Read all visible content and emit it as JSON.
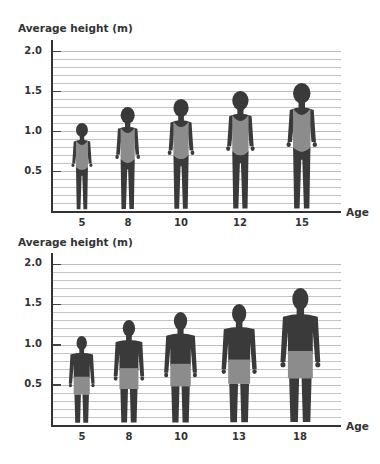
{
  "colors": {
    "body": "#3a3a3a",
    "clothing": "#8c8c8c",
    "grid": "#c4c4c4",
    "axis": "#333333"
  },
  "chart_data": [
    {
      "type": "bar",
      "title": "Average height by age (girls)",
      "ylabel": "Average height (m)",
      "xlabel": "Age",
      "categories": [
        "5",
        "8",
        "10",
        "12",
        "15"
      ],
      "values": [
        1.1,
        1.3,
        1.4,
        1.5,
        1.6
      ],
      "yticks": [
        "2.0",
        "1.5",
        "1.0",
        "0.5"
      ],
      "ylim": [
        0,
        2.0
      ],
      "minor_grid_step": 0.1,
      "grid": true,
      "marker": "girl-silhouette"
    },
    {
      "type": "bar",
      "title": "Average height by age (boys)",
      "ylabel": "Average height (m)",
      "xlabel": "Age",
      "categories": [
        "5",
        "8",
        "10",
        "13",
        "18"
      ],
      "values": [
        1.1,
        1.3,
        1.4,
        1.5,
        1.7
      ],
      "yticks": [
        "2.0",
        "1.5",
        "1.0",
        "0.5"
      ],
      "ylim": [
        0,
        2.0
      ],
      "minor_grid_step": 0.1,
      "grid": true,
      "marker": "boy-silhouette"
    }
  ],
  "charts": [
    {
      "ylabel": "Average height (m)",
      "xlabel": "Age",
      "yticks": [
        "2.0",
        "1.5",
        "1.0",
        "0.5"
      ],
      "xticks": [
        "5",
        "8",
        "10",
        "12",
        "15"
      ]
    },
    {
      "ylabel": "Average height (m)",
      "xlabel": "Age",
      "yticks": [
        "2.0",
        "1.5",
        "1.0",
        "0.5"
      ],
      "xticks": [
        "5",
        "8",
        "10",
        "13",
        "18"
      ]
    }
  ]
}
